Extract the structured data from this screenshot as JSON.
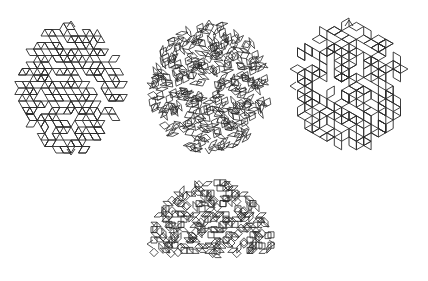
{
  "figure": {
    "width": 428,
    "height": 281,
    "background": "#ffffff",
    "stroke_color": "#2a2a2a",
    "panels": [
      {
        "id": "tiling-a",
        "name": "rhombic-tiling-disk-left",
        "outline": "circle",
        "cx": 71,
        "cy": 88,
        "rx": 55,
        "ry": 67,
        "symmetry": 6,
        "edge": 7.5,
        "rotation": 0,
        "stroke_width": 0.9,
        "hole": {
          "cx": 96,
          "cy": 86,
          "r": 9
        },
        "spikes": [
          [
            71,
            21
          ],
          [
            71,
            155
          ]
        ]
      },
      {
        "id": "tiling-b",
        "name": "decagonal-tiling-disk-center",
        "outline": "circle",
        "cx": 209,
        "cy": 87,
        "rx": 62,
        "ry": 67,
        "symmetry": 10,
        "edge": 6.5,
        "rotation": 9,
        "stroke_width": 0.8,
        "hole": {
          "cx": 209,
          "cy": 84,
          "r": 10
        },
        "spikes": [
          [
            209,
            20
          ],
          [
            209,
            154
          ]
        ]
      },
      {
        "id": "tiling-c",
        "name": "cubic-rhombic-tiling-disk-right",
        "outline": "circle",
        "cx": 349,
        "cy": 86,
        "rx": 58,
        "ry": 66,
        "symmetry": 6,
        "edge": 8.5,
        "rotation": 30,
        "stroke_width": 0.9,
        "hole": {
          "cx": 329,
          "cy": 86,
          "r": 10
        },
        "spikes": [
          [
            349,
            20
          ],
          [
            290,
            86
          ]
        ]
      },
      {
        "id": "tiling-d",
        "name": "rhombic-tiling-half-dome-bottom",
        "outline": "half",
        "cx": 211,
        "cy": 243,
        "rx": 64,
        "ry": 65,
        "symmetry": 8,
        "edge": 6,
        "rotation": 0,
        "stroke_width": 0.8,
        "hole": null,
        "bottom": 258,
        "spikes": [
          [
            147,
            244
          ],
          [
            275,
            244
          ]
        ]
      }
    ]
  }
}
